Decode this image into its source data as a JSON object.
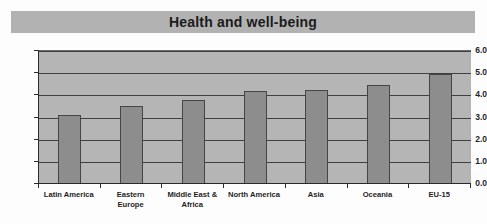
{
  "chart_data": {
    "type": "bar",
    "title": "Health and well-being",
    "xlabel": "",
    "ylabel": "",
    "categories": [
      "Latin America",
      "Eastern\nEurope",
      "Middle East &\nAfrica",
      "North America",
      "Asia",
      "Oceania",
      "EU-15"
    ],
    "values": [
      3.1,
      3.5,
      3.8,
      4.2,
      4.25,
      4.45,
      4.95
    ],
    "ylim": [
      0.0,
      6.0
    ],
    "ytick_labels": [
      "0.0",
      "1.0",
      "2.0",
      "3.0",
      "4.0",
      "5.0",
      "6.0"
    ],
    "ytick_values": [
      0.0,
      1.0,
      2.0,
      3.0,
      4.0,
      5.0,
      6.0
    ],
    "grid": true,
    "legend": false,
    "legend_position": "none",
    "series_name": "Health and well-being",
    "colors": {
      "bar_fill": "#8d8d8d",
      "bar_edge": "#454545",
      "plot_background": "#b5b5b5",
      "title_banner": "#b2b2b2",
      "gridline": "#3f3f3f",
      "axis": "#2a2a2a",
      "text": "#1f1f1f",
      "figure_background": "#fdfdfd"
    }
  }
}
